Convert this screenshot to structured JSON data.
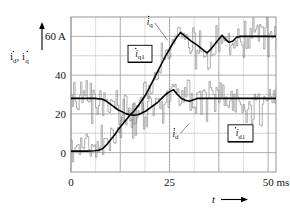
{
  "figure": {
    "name": "d-q axis current step response",
    "background": "#ffffff"
  },
  "axes": {
    "y": {
      "label": "i_d, i_q",
      "label_parts": {
        "first": "i",
        "first_sub": "d",
        "sep": ", ",
        "second": "i",
        "second_sub": "q"
      },
      "unit": "A",
      "unit_label": "60 A",
      "ticks": [
        0,
        20,
        40,
        60
      ],
      "tick_labels": [
        "0",
        "20",
        "40",
        "60 A"
      ],
      "min": -10,
      "max": 70,
      "arrow": "up-arrow-icon"
    },
    "x": {
      "label": "t",
      "unit": "ms",
      "ticks": [
        0,
        25,
        50
      ],
      "tick_labels": [
        "0",
        "25",
        "50 ms"
      ],
      "min": 0,
      "max": 52,
      "arrow": "right-arrow-icon"
    },
    "grid": {
      "major_color": "#9a9a9a",
      "minor_color": "#c8c8c8",
      "dotted_color": "#b0b0b0",
      "major_x": [
        0,
        12.5,
        25,
        37.5,
        50
      ],
      "major_y": [
        0,
        20,
        40,
        60
      ],
      "minor_x": [
        6.25,
        18.75,
        31.25,
        43.75
      ],
      "minor_y": [
        10,
        30,
        50
      ],
      "dotted_vertical_x": 25
    }
  },
  "legend": {
    "labels": [
      {
        "name": "iq-raw-label",
        "text": "i",
        "sub": "q",
        "accent": "dot",
        "boxed": false
      },
      {
        "name": "iq1-filtered-label",
        "text": "i",
        "sub": "q1",
        "accent": "dot",
        "boxed": true
      },
      {
        "name": "id-raw-label",
        "text": "i",
        "sub": "d",
        "accent": "dot",
        "boxed": false
      },
      {
        "name": "id1-filtered-label",
        "text": "i",
        "sub": "d1",
        "accent": "dot",
        "boxed": true
      }
    ]
  },
  "chart_data": {
    "type": "line",
    "title": "",
    "subtitle": "",
    "xlabel": "t",
    "ylabel": "i_d, i_q",
    "xunit": "ms",
    "yunit": "A",
    "xlim": [
      0,
      52
    ],
    "ylim": [
      -10,
      70
    ],
    "xticks": [
      0,
      25,
      50
    ],
    "yticks": [
      0,
      20,
      40,
      60
    ],
    "grid": true,
    "legend_position": "in-plot-annotations",
    "series": [
      {
        "name": "i_q1",
        "style": "thick-black-smooth",
        "color": "#000000",
        "width": 1.6,
        "description": "filtered q-axis current, steps from 0 A up to ~60 A",
        "x": [
          0,
          2,
          4,
          6,
          7,
          8,
          9,
          10,
          11,
          12,
          13,
          14,
          15,
          16,
          17,
          18,
          19,
          20,
          21,
          22,
          23,
          24,
          25,
          26,
          27,
          27.8,
          29,
          30.5,
          32,
          33.5,
          34.5,
          35.5,
          36.5,
          37.5,
          38.3,
          39.2,
          40,
          41,
          42,
          43,
          45,
          47,
          50,
          52
        ],
        "y": [
          0.8,
          0.8,
          0.8,
          1.0,
          1.2,
          2.0,
          4.0,
          6.5,
          9.0,
          12.0,
          14.5,
          17.0,
          19.5,
          21.5,
          24.0,
          27.0,
          30.0,
          34.0,
          38.0,
          42.0,
          46.0,
          50.0,
          53.5,
          57.0,
          60.0,
          62.0,
          60.0,
          57.5,
          55.5,
          53.0,
          51.5,
          53.5,
          56.0,
          58.5,
          60.5,
          58.5,
          57.0,
          57.5,
          59.5,
          60.0,
          60.0,
          60.0,
          60.0,
          60.0
        ]
      },
      {
        "name": "i_d1",
        "style": "thick-black-smooth",
        "color": "#000000",
        "width": 1.6,
        "description": "filtered d-axis current, starts ~28 A, dips to ~19 A, peaks ~32 A, settles ~28 A",
        "x": [
          0,
          3,
          6,
          8,
          9,
          10,
          11,
          12,
          13,
          14,
          15,
          16,
          17,
          18,
          19,
          20,
          21,
          22,
          23,
          24,
          25,
          26,
          27,
          28,
          29,
          30,
          32,
          35,
          38,
          42,
          46,
          50,
          52
        ],
        "y": [
          28,
          28,
          28,
          27.5,
          26.5,
          25.0,
          23.5,
          22.0,
          21.0,
          20.0,
          19.5,
          19.3,
          19.6,
          20.5,
          21.5,
          23.0,
          24.5,
          26.0,
          28.0,
          30.0,
          31.5,
          32.5,
          30.0,
          28.0,
          27.0,
          26.5,
          28.0,
          28.0,
          28.0,
          28.0,
          28.0,
          28.0,
          28.0
        ]
      },
      {
        "name": "i_q",
        "style": "thin-gray-noisy",
        "color": "#7a7a7a",
        "width": 0.6,
        "description": "raw measured q-axis current, heavy sample-and-hold noise around i_q1",
        "noise_amplitude": 9
      },
      {
        "name": "i_d",
        "style": "thin-gray-noisy",
        "color": "#7a7a7a",
        "width": 0.6,
        "description": "raw measured d-axis current, heavy sample-and-hold noise around i_d1",
        "noise_amplitude": 9
      }
    ],
    "annotations": [
      {
        "text": "i_q",
        "x": 20,
        "y": 66,
        "leader_to_x": 24.5,
        "leader_to_y": 58
      },
      {
        "text": "i_q1",
        "x": 17.5,
        "y": 51,
        "boxed": true
      },
      {
        "text": "i_d",
        "x": 26.5,
        "y": 8,
        "leader_to_x": 30,
        "leader_to_y": 15
      },
      {
        "text": "i_d1",
        "x": 43,
        "y": 10,
        "boxed": true
      }
    ]
  }
}
